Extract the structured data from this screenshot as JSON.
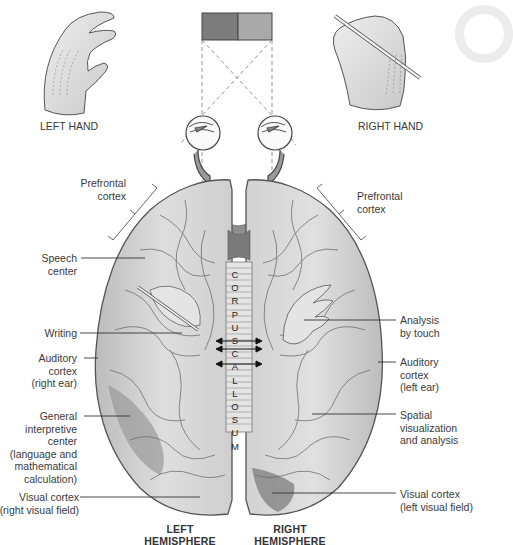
{
  "diagram": {
    "stimulus": {
      "left_color": "#7c7c7c",
      "right_color": "#a9a9a9"
    },
    "hands": {
      "left": {
        "label": "LEFT HAND"
      },
      "right": {
        "label": "RIGHT HAND"
      }
    },
    "corpus_callosum": {
      "letters": [
        "C",
        "O",
        "R",
        "P",
        "U",
        "S",
        "C",
        "A",
        "L",
        "L",
        "O",
        "S",
        "U",
        "M"
      ]
    },
    "hemispheres": {
      "left": {
        "line1": "LEFT",
        "line2": "HEMISPHERE"
      },
      "right": {
        "line1": "RIGHT",
        "line2": "HEMISPHERE"
      }
    },
    "labels_left": [
      {
        "id": "prefrontal-cortex-left",
        "lines": [
          "Prefrontal",
          "cortex"
        ]
      },
      {
        "id": "speech-center",
        "lines": [
          "Speech",
          "center"
        ]
      },
      {
        "id": "writing",
        "lines": [
          "Writing"
        ]
      },
      {
        "id": "auditory-cortex-right-ear",
        "lines": [
          "Auditory",
          "cortex",
          "(right ear)"
        ]
      },
      {
        "id": "general-interpretive-center",
        "lines": [
          "General",
          "interpretive",
          "center",
          "(language and",
          "mathematical",
          "calculation)"
        ]
      },
      {
        "id": "visual-cortex-right-field",
        "lines": [
          "Visual cortex",
          "(right visual field)"
        ]
      }
    ],
    "labels_right": [
      {
        "id": "prefrontal-cortex-right",
        "lines": [
          "Prefrontal",
          "cortex"
        ]
      },
      {
        "id": "analysis-by-touch",
        "lines": [
          "Analysis",
          "by touch"
        ]
      },
      {
        "id": "auditory-cortex-left-ear",
        "lines": [
          "Auditory",
          "cortex",
          "(left ear)"
        ]
      },
      {
        "id": "spatial-visualization",
        "lines": [
          "Spatial",
          "visualization",
          "and analysis"
        ]
      },
      {
        "id": "visual-cortex-left-field",
        "lines": [
          "Visual cortex",
          "(left visual field)"
        ]
      }
    ],
    "colors": {
      "brain_fill": "#d9d9d9",
      "brain_shade": "#b8b8b8",
      "brain_outline": "#555555",
      "dark_region": "#8f8f8f",
      "leader_line": "#333333"
    }
  }
}
